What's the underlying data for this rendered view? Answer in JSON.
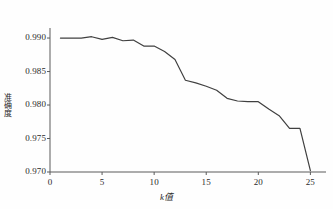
{
  "chart_data": {
    "type": "line",
    "title": "",
    "xlabel": "k值",
    "ylabel": "准确度",
    "x": [
      1,
      2,
      3,
      4,
      5,
      6,
      7,
      8,
      9,
      10,
      11,
      12,
      13,
      14,
      15,
      16,
      17,
      18,
      19,
      20,
      21,
      22,
      23,
      24,
      25
    ],
    "values": [
      0.99,
      0.99,
      0.99,
      0.9902,
      0.9898,
      0.9901,
      0.9896,
      0.9897,
      0.9888,
      0.9888,
      0.988,
      0.9868,
      0.9837,
      0.9833,
      0.9828,
      0.9822,
      0.981,
      0.9806,
      0.9805,
      0.9805,
      0.9794,
      0.9784,
      0.9765,
      0.9765,
      0.9702
    ],
    "series": [
      {
        "name": "准确度",
        "values": [
          0.99,
          0.99,
          0.99,
          0.9902,
          0.9898,
          0.9901,
          0.9896,
          0.9897,
          0.9888,
          0.9888,
          0.988,
          0.9868,
          0.9837,
          0.9833,
          0.9828,
          0.9822,
          0.981,
          0.9806,
          0.9805,
          0.9805,
          0.9794,
          0.9784,
          0.9765,
          0.9765,
          0.9702
        ]
      }
    ],
    "xlim": [
      0,
      26.5
    ],
    "ylim": [
      0.97,
      0.9915
    ],
    "xticks": [
      0,
      5,
      10,
      15,
      20,
      25
    ],
    "xtick_labels": [
      "0",
      "5",
      "10",
      "15",
      "20",
      "25"
    ],
    "yticks": [
      0.97,
      0.975,
      0.98,
      0.985,
      0.99
    ],
    "ytick_labels": [
      "0.970",
      "0.975",
      "0.980",
      "0.985",
      "0.990"
    ],
    "grid": false,
    "legend": null,
    "line_color": "#404040",
    "axis_color": "#5a5a5a"
  }
}
